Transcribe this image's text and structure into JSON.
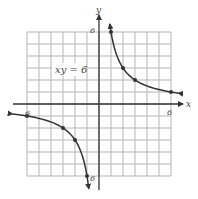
{
  "chart_data": {
    "type": "line",
    "title": "",
    "equation_label": "xy = 6",
    "xlabel": "x",
    "ylabel": "y",
    "xlim": [
      -6,
      6
    ],
    "ylim": [
      -6,
      6
    ],
    "grid": true,
    "tick_labels": {
      "x_pos": "6",
      "x_neg": "6",
      "y_pos": "6",
      "y_neg": "6"
    },
    "series": [
      {
        "name": "branch-quadrant-1",
        "points": [
          [
            1,
            6
          ],
          [
            2,
            3
          ],
          [
            3,
            2
          ],
          [
            6,
            1
          ]
        ],
        "curve": "y = 6/x, x > 0"
      },
      {
        "name": "branch-quadrant-3",
        "points": [
          [
            -6,
            -1
          ],
          [
            -3,
            -2
          ],
          [
            -2,
            -3
          ],
          [
            -1,
            -6
          ]
        ],
        "curve": "y = 6/x, x < 0"
      }
    ],
    "colors": {
      "grid": "#b5b5b5",
      "axis": "#333333",
      "curve": "#333333"
    }
  }
}
